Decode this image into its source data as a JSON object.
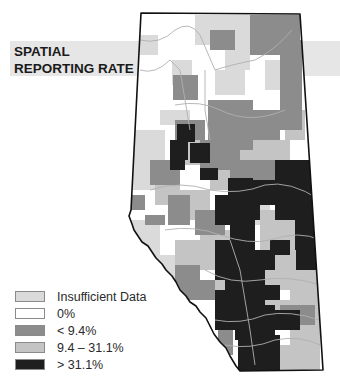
{
  "title": {
    "line1": "SPATIAL",
    "line2": "REPORTING RATE"
  },
  "colors": {
    "insufficient": "#dadada",
    "zero": "#ffffff",
    "low": "#8c8c8c",
    "mid": "#c4c4c4",
    "high": "#1e1e1e",
    "banner": "#e6e6e6",
    "border": "#111111",
    "rivers": "#b0b0b0"
  },
  "legend": {
    "items": [
      {
        "label": "Insufficient Data",
        "color": "#dadada"
      },
      {
        "label": "0%",
        "color": "#ffffff"
      },
      {
        "label": "< 9.4%",
        "color": "#8c8c8c"
      },
      {
        "label": "9.4 – 31.1%",
        "color": "#c4c4c4"
      },
      {
        "label": "> 31.1%",
        "color": "#1e1e1e"
      }
    ]
  }
}
